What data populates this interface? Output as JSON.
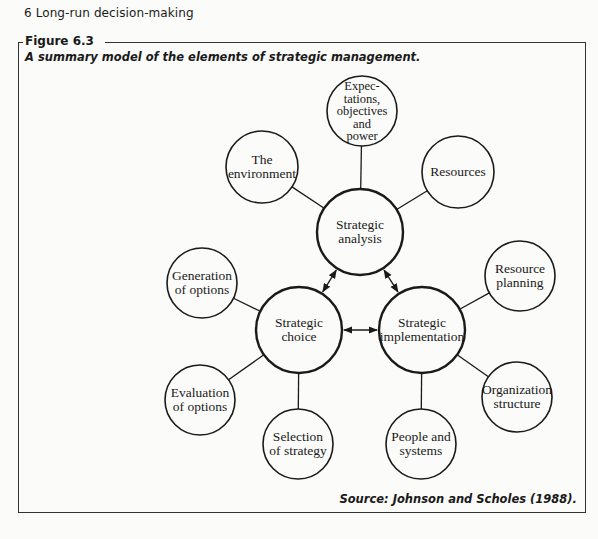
{
  "page": {
    "running_head": "6   Long-run decision-making"
  },
  "figure": {
    "label": "Figure 6.3",
    "caption": "A summary model of the elements of strategic management.",
    "source": "Source: Johnson and Scholes (1988)."
  },
  "diagram": {
    "nodes": [
      {
        "id": "analysis",
        "label": "Strategic\nanalysis",
        "cx": 360,
        "cy": 232,
        "r": 43,
        "primary": true
      },
      {
        "id": "choice",
        "label": "Strategic\nchoice",
        "cx": 299,
        "cy": 330,
        "r": 43,
        "primary": true
      },
      {
        "id": "implementation",
        "label": "Strategic\nimplementation",
        "cx": 422,
        "cy": 330,
        "r": 43,
        "primary": true
      },
      {
        "id": "expectations",
        "label": "Expec-\ntations,\nobjectives\nand\npower",
        "cx": 362,
        "cy": 111,
        "r": 35,
        "primary": false
      },
      {
        "id": "environment",
        "label": "The\nenvironment",
        "cx": 262,
        "cy": 167,
        "r": 36,
        "primary": false
      },
      {
        "id": "resources",
        "label": "Resources",
        "cx": 458,
        "cy": 172,
        "r": 36,
        "primary": false
      },
      {
        "id": "generation",
        "label": "Generation\nof options",
        "cx": 202,
        "cy": 283,
        "r": 35,
        "primary": false
      },
      {
        "id": "evaluation",
        "label": "Evaluation\nof options",
        "cx": 200,
        "cy": 400,
        "r": 35,
        "primary": false
      },
      {
        "id": "selection",
        "label": "Selection\nof strategy",
        "cx": 298,
        "cy": 444,
        "r": 35,
        "primary": false
      },
      {
        "id": "resource_planning",
        "label": "Resource\nplanning",
        "cx": 520,
        "cy": 276,
        "r": 35,
        "primary": false
      },
      {
        "id": "organization",
        "label": "Organization\nstructure",
        "cx": 517,
        "cy": 397,
        "r": 35,
        "primary": false
      },
      {
        "id": "people",
        "label": "People and\nsystems",
        "cx": 421,
        "cy": 444,
        "r": 35,
        "primary": false
      }
    ],
    "edges": [
      {
        "from": "analysis",
        "to": "expectations",
        "type": "line"
      },
      {
        "from": "analysis",
        "to": "environment",
        "type": "line"
      },
      {
        "from": "analysis",
        "to": "resources",
        "type": "line"
      },
      {
        "from": "choice",
        "to": "generation",
        "type": "line"
      },
      {
        "from": "choice",
        "to": "evaluation",
        "type": "line"
      },
      {
        "from": "choice",
        "to": "selection",
        "type": "line"
      },
      {
        "from": "implementation",
        "to": "resource_planning",
        "type": "line"
      },
      {
        "from": "implementation",
        "to": "organization",
        "type": "line"
      },
      {
        "from": "implementation",
        "to": "people",
        "type": "line"
      },
      {
        "from": "analysis",
        "to": "choice",
        "type": "double-arrow"
      },
      {
        "from": "analysis",
        "to": "implementation",
        "type": "double-arrow"
      },
      {
        "from": "choice",
        "to": "implementation",
        "type": "double-arrow"
      }
    ],
    "stroke_color": "#1a1a1a"
  }
}
